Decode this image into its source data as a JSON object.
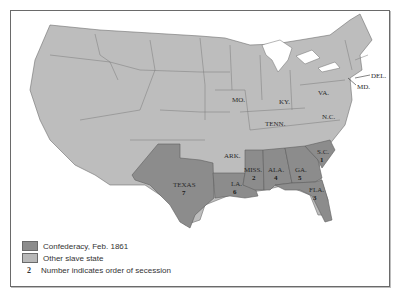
{
  "map": {
    "title": "Secession of the Lower South",
    "colors": {
      "confederacy": "#8c8c8c",
      "other_slave": "#b8b8b8",
      "other": "#bdbdbd",
      "border": "#6f6f6f",
      "water": "#ffffff"
    },
    "state_labels": [
      {
        "name": "MO.",
        "x": 232,
        "y": 102
      },
      {
        "name": "KY.",
        "x": 283,
        "y": 104
      },
      {
        "name": "VA.",
        "x": 321,
        "y": 95
      },
      {
        "name": "N.C.",
        "x": 328,
        "y": 119
      },
      {
        "name": "TENN.",
        "x": 278,
        "y": 126
      },
      {
        "name": "ARK.",
        "x": 230,
        "y": 156
      },
      {
        "name": "DEL.",
        "x": 372,
        "y": 77
      },
      {
        "name": "MD.",
        "x": 354,
        "y": 87
      }
    ],
    "confederate_states": [
      {
        "name": "S.C.",
        "order": "1",
        "x": 322,
        "y": 153
      },
      {
        "name": "MISS.",
        "order": "2",
        "x": 255,
        "y": 170
      },
      {
        "name": "FLA.",
        "order": "3",
        "x": 315,
        "y": 192
      },
      {
        "name": "ALA.",
        "order": "4",
        "x": 277,
        "y": 170
      },
      {
        "name": "GA.",
        "order": "5",
        "x": 298,
        "y": 176
      },
      {
        "name": "LA.",
        "order": "6",
        "x": 237,
        "y": 185
      },
      {
        "name": "TEXAS",
        "order": "7",
        "x": 181,
        "y": 186
      }
    ]
  },
  "legend": {
    "items": [
      {
        "label": "Confederacy, Feb. 1861",
        "swatch": "#8c8c8c"
      },
      {
        "label": "Other slave state",
        "swatch": "#b8b8b8"
      },
      {
        "label": "Number indicates order of secession",
        "marker": "2"
      }
    ]
  }
}
